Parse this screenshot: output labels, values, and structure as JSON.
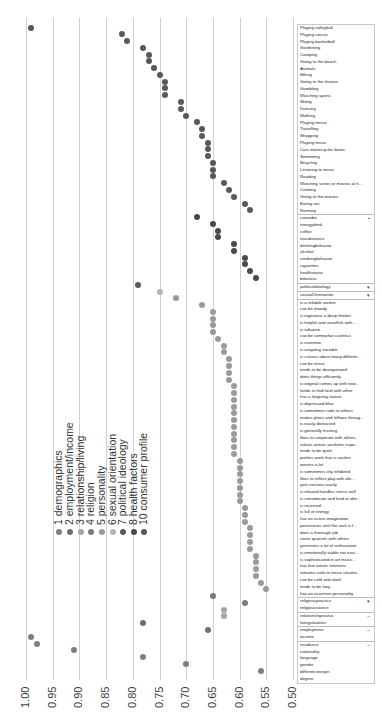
{
  "chart_data": {
    "type": "scatter",
    "orientation": "rotated-dot-plot",
    "title": "",
    "xlabel": "",
    "ylabel": "",
    "value_axis": {
      "range": [
        1.0,
        0.5
      ],
      "ticks": [
        "1.00",
        "0.95",
        "0.90",
        "0.85",
        "0.80",
        "0.75",
        "0.70",
        "0.65",
        "0.60",
        "0.55",
        "0.50"
      ],
      "grid": true
    },
    "legend": [
      {
        "id": 1,
        "label": "1 demographics",
        "color": "#7f7f7f"
      },
      {
        "id": 2,
        "label": "2 employment/income",
        "color": "#6e6e6e"
      },
      {
        "id": 3,
        "label": "3 relationship/living",
        "color": "#a6a6a6"
      },
      {
        "id": 4,
        "label": "4 religion",
        "color": "#7a7a7a"
      },
      {
        "id": 5,
        "label": "5 personality",
        "color": "#9a9a9a"
      },
      {
        "id": 6,
        "label": "6 sexual orientation",
        "color": "#b4b4b4"
      },
      {
        "id": 7,
        "label": "7 political ideology",
        "color": "#5a5a5a"
      },
      {
        "id": 8,
        "label": "8 health factors",
        "color": "#4a4a4a"
      },
      {
        "id": 10,
        "label": "10 consumer profile",
        "color": "#595959"
      }
    ],
    "points": [
      {
        "label": "Playing volleyball",
        "group": 10,
        "value": 0.99
      },
      {
        "label": "Playing soccer",
        "group": 10,
        "value": 0.82
      },
      {
        "label": "Playing basketball",
        "group": 10,
        "value": 0.81
      },
      {
        "label": "Gardening",
        "group": 10,
        "value": 0.78
      },
      {
        "label": "Camping",
        "group": 10,
        "value": 0.77
      },
      {
        "label": "Going to the beach",
        "group": 10,
        "value": 0.77
      },
      {
        "label": "Animals",
        "group": 10,
        "value": 0.76
      },
      {
        "label": "Hiking",
        "group": 10,
        "value": 0.75
      },
      {
        "label": "Going to the theatre",
        "group": 10,
        "value": 0.74
      },
      {
        "label": "Gambling",
        "group": 10,
        "value": 0.74
      },
      {
        "label": "Watching sports",
        "group": 10,
        "value": 0.74
      },
      {
        "label": "Skiing",
        "group": 10,
        "value": 0.71
      },
      {
        "label": "Dancing",
        "group": 10,
        "value": 0.71
      },
      {
        "label": "Walking",
        "group": 10,
        "value": 0.7
      },
      {
        "label": "Playing tennis",
        "group": 10,
        "value": 0.68
      },
      {
        "label": "Travelling",
        "group": 10,
        "value": 0.67
      },
      {
        "label": "Shopping",
        "group": 10,
        "value": 0.67
      },
      {
        "label": "Playing music",
        "group": 10,
        "value": 0.66
      },
      {
        "label": "Cars motorcycles boats",
        "group": 10,
        "value": 0.66
      },
      {
        "label": "Swimming",
        "group": 10,
        "value": 0.66
      },
      {
        "label": "Bicycling",
        "group": 10,
        "value": 0.65
      },
      {
        "label": "Listening to music",
        "group": 10,
        "value": 0.65
      },
      {
        "label": "Reading",
        "group": 10,
        "value": 0.65
      },
      {
        "label": "Watching series or movies at h...",
        "group": 10,
        "value": 0.63
      },
      {
        "label": "Cooking",
        "group": 10,
        "value": 0.62
      },
      {
        "label": "Going to the movies",
        "group": 10,
        "value": 0.61
      },
      {
        "label": "Eating out",
        "group": 10,
        "value": 0.59
      },
      {
        "label": "Running",
        "group": 10,
        "value": 0.58
      },
      {
        "label": "cannabis",
        "group": 8,
        "value": 0.68
      },
      {
        "label": "energydrink",
        "group": 8,
        "value": 0.65
      },
      {
        "label": "coffee",
        "group": 8,
        "value": 0.64
      },
      {
        "label": "nosubstance",
        "group": 8,
        "value": 0.64
      },
      {
        "label": "drinkingbehavior",
        "group": 8,
        "value": 0.61
      },
      {
        "label": "alcohol",
        "group": 8,
        "value": 0.61
      },
      {
        "label": "smokingbehavior",
        "group": 8,
        "value": 0.59
      },
      {
        "label": "cigarettes",
        "group": 8,
        "value": 0.59
      },
      {
        "label": "healthstatus",
        "group": 8,
        "value": 0.58
      },
      {
        "label": "bmiclass",
        "group": 8,
        "value": 0.57
      },
      {
        "label": "politicalideology",
        "group": 7,
        "value": 0.79
      },
      {
        "label": "sexualOrientation",
        "group": 6,
        "value": 0.75
      },
      {
        "label": "is a reliable worker",
        "group": 5,
        "value": 0.72
      },
      {
        "label": "can be moody",
        "group": 5,
        "value": 0.67
      },
      {
        "label": "is ingenious a deep thinker",
        "group": 5,
        "value": 0.65
      },
      {
        "label": "is helpful and unselfish with...",
        "group": 5,
        "value": 0.65
      },
      {
        "label": "is talkative",
        "group": 5,
        "value": 0.65
      },
      {
        "label": "can be somewhat careless",
        "group": 5,
        "value": 0.65
      },
      {
        "label": "is inventive",
        "group": 5,
        "value": 0.64
      },
      {
        "label": "is outgoing sociable",
        "group": 5,
        "value": 0.63
      },
      {
        "label": "is curious about many differen...",
        "group": 5,
        "value": 0.63
      },
      {
        "label": "can be tense",
        "group": 5,
        "value": 0.62
      },
      {
        "label": "tends to be disorganized",
        "group": 5,
        "value": 0.62
      },
      {
        "label": "does things efficiently",
        "group": 5,
        "value": 0.62
      },
      {
        "label": "is original comes up with new...",
        "group": 5,
        "value": 0.62
      },
      {
        "label": "tends to find fault with other",
        "group": 5,
        "value": 0.61
      },
      {
        "label": "has a forgiving nature",
        "group": 5,
        "value": 0.61
      },
      {
        "label": "is depressed blue",
        "group": 5,
        "value": 0.61
      },
      {
        "label": "is sometimes rude to others",
        "group": 5,
        "value": 0.61
      },
      {
        "label": "makes plans and follows throug...",
        "group": 5,
        "value": 0.61
      },
      {
        "label": "is easily distracted",
        "group": 5,
        "value": 0.61
      },
      {
        "label": "is generally trusting",
        "group": 5,
        "value": 0.61
      },
      {
        "label": "likes to cooperate with others",
        "group": 5,
        "value": 0.61
      },
      {
        "label": "values artistic aesthetic expe...",
        "group": 5,
        "value": 0.61
      },
      {
        "label": "tends to be quiet",
        "group": 5,
        "value": 0.61
      },
      {
        "label": "prefers work that is routine",
        "group": 5,
        "value": 0.61
      },
      {
        "label": "worries a lot",
        "group": 5,
        "value": 0.6
      },
      {
        "label": "is sometimes shy inhibited",
        "group": 5,
        "value": 0.6
      },
      {
        "label": "likes to reflect play with ide...",
        "group": 5,
        "value": 0.6
      },
      {
        "label": "gets nervous easily",
        "group": 5,
        "value": 0.6
      },
      {
        "label": "is relaxed handles stress well",
        "group": 5,
        "value": 0.6
      },
      {
        "label": "is considerate and kind to alm...",
        "group": 5,
        "value": 0.6
      },
      {
        "label": "is reserved",
        "group": 5,
        "value": 0.6
      },
      {
        "label": "is full of energy",
        "group": 5,
        "value": 0.59
      },
      {
        "label": "has an active imagination",
        "group": 5,
        "value": 0.59
      },
      {
        "label": "perseveres until the task is f...",
        "group": 5,
        "value": 0.59
      },
      {
        "label": "does a thorough job",
        "group": 5,
        "value": 0.58
      },
      {
        "label": "starts quarrels with others",
        "group": 5,
        "value": 0.58
      },
      {
        "label": "generates a lot of enthusiasm",
        "group": 5,
        "value": 0.58
      },
      {
        "label": "is emotionally stable not easi...",
        "group": 5,
        "value": 0.58
      },
      {
        "label": "is sophisticated in art music...",
        "group": 5,
        "value": 0.57
      },
      {
        "label": "has few artistic interests",
        "group": 5,
        "value": 0.57
      },
      {
        "label": "remains calm in tense situatio...",
        "group": 5,
        "value": 0.57
      },
      {
        "label": "can be cold and aloof",
        "group": 5,
        "value": 0.57
      },
      {
        "label": "tends to be lazy",
        "group": 5,
        "value": 0.56
      },
      {
        "label": "has an assertive personality",
        "group": 5,
        "value": 0.55
      },
      {
        "label": "religiouspractice",
        "group": 4,
        "value": 0.65
      },
      {
        "label": "religiousstance",
        "group": 4,
        "value": 0.59
      },
      {
        "label": "relationshipstatus",
        "group": 3,
        "value": 0.63
      },
      {
        "label": "livingsituation",
        "group": 3,
        "value": 0.63
      },
      {
        "label": "employment",
        "group": 2,
        "value": 0.78
      },
      {
        "label": "income",
        "group": 2,
        "value": 0.66
      },
      {
        "label": "residence",
        "group": 1,
        "value": 0.99
      },
      {
        "label": "nationality",
        "group": 1,
        "value": 0.98
      },
      {
        "label": "language",
        "group": 1,
        "value": 0.91
      },
      {
        "label": "gender",
        "group": 1,
        "value": 0.78
      },
      {
        "label": "differenceorigin",
        "group": 1,
        "value": 0.7
      },
      {
        "label": "degree",
        "group": 1,
        "value": 0.56
      }
    ],
    "group_starts": [
      0,
      28,
      38,
      39,
      40,
      84,
      86,
      88,
      90
    ],
    "group_marks": [
      "",
      "▪",
      "▾",
      "▾",
      "",
      "▾",
      "–",
      "–",
      "–"
    ]
  }
}
